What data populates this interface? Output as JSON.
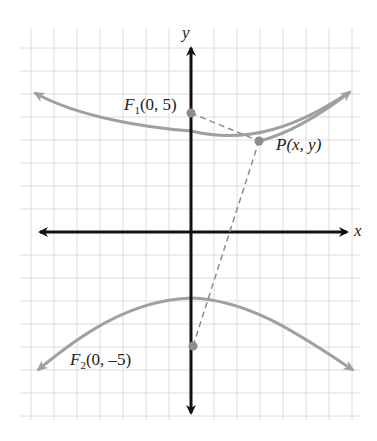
{
  "figure": {
    "type": "hyperbola-diagram",
    "axes": {
      "x_label": "x",
      "y_label": "y"
    },
    "foci": [
      {
        "name": "F1",
        "label": "F",
        "sub": "1",
        "coords": "(0, 5)"
      },
      {
        "name": "F2",
        "label": "F",
        "sub": "2",
        "coords": "(0, –5)"
      }
    ],
    "point": {
      "label": "P",
      "coords": "(x, y)"
    },
    "colors": {
      "curve": "#a0a0a0",
      "axis": "#111111",
      "grid": "#d9d9d9",
      "point": "#8c8c8c",
      "dashed": "#8c8c8c"
    }
  }
}
